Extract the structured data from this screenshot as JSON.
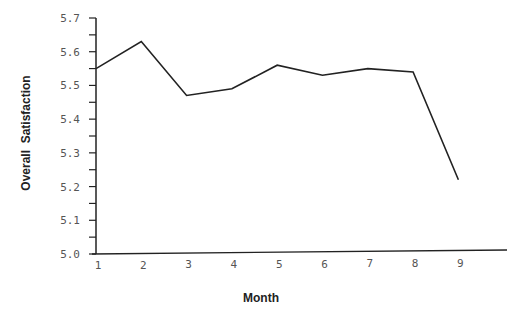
{
  "chart_data": {
    "type": "line",
    "title": "",
    "xlabel": "Month",
    "ylabel": "Overall  Satisfaction",
    "x": [
      1,
      2,
      3,
      4,
      5,
      6,
      7,
      8,
      9
    ],
    "x_tick_labels": [
      "1",
      "2",
      "3",
      "4",
      "5",
      "6",
      "7",
      "8",
      "9"
    ],
    "series": [
      {
        "name": "Overall Satisfaction",
        "values": [
          5.55,
          5.63,
          5.47,
          5.49,
          5.56,
          5.53,
          5.55,
          5.54,
          5.22
        ]
      }
    ],
    "ylim": [
      5.0,
      5.7
    ],
    "y_ticks": [
      5.0,
      5.1,
      5.2,
      5.3,
      5.4,
      5.5,
      5.6,
      5.7
    ],
    "y_tick_labels": [
      "5.0",
      "5.1",
      "5.2",
      "5.3",
      "5.4",
      "5.5",
      "5.6",
      "5.7"
    ],
    "y_minor_ticks": true,
    "grid": false,
    "legend": "none",
    "line_color": "#222222"
  }
}
